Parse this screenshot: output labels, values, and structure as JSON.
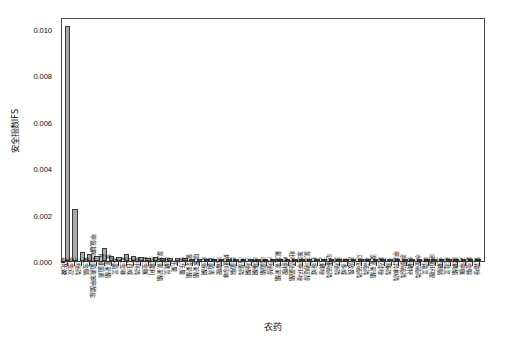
{
  "chart_data": {
    "type": "bar",
    "title": "",
    "xlabel": "农药",
    "ylabel": "安全指数IFS",
    "ylim": [
      0.0,
      0.0105
    ],
    "grid": false,
    "legend": null,
    "ytick_labels": [
      "0.000",
      "0.002",
      "0.004",
      "0.006",
      "0.008",
      "0.010"
    ],
    "ytick_values": [
      0.0,
      0.002,
      0.004,
      0.006,
      0.008,
      0.01
    ],
    "bar_color": "#a9a9a9",
    "bar_edge_color": "#3b3b3b",
    "categories": [
      "毒死蜱",
      "杀虫双",
      "三唑磷",
      "氟虫腈",
      "甲氨基阿维菌素苯甲酸盐",
      "阿维菌素",
      "氯氰菊酯",
      "多菌灵",
      "吡虫啉",
      "克百威",
      "甲拌磷",
      "啶虫脒",
      "腐霉利",
      "氯氟氰菊酯",
      "哒螨灵",
      "乐果",
      "氧乐果",
      "氰戊菊酯",
      "联苯菊酯",
      "吡蚜酮",
      "百菌清",
      "嘧霉胺",
      "烯酰吗啉",
      "异菌脲",
      "丙溴磷",
      "三唑酮",
      "噻嗪酮",
      "嘧菌酯",
      "戊唑醇",
      "氟氯氰菊酯",
      "咪鲜胺",
      "吡唑醚菌酯",
      "苯醚甲环唑",
      "氯苯嘧啶醇",
      "抗蚜威",
      "乙螨唑",
      "哒嗪硫磷",
      "氯唑磷",
      "灭多威",
      "敌敌畏",
      "马拉硫磷",
      "辛硫磷",
      "溴氰菊酯",
      "氟硅唑",
      "二嗪磷",
      "甲基异柳磷",
      "杀螟硫磷",
      "炔螨特",
      "水胺硫磷",
      "甲霜灵",
      "嘧菌环胺",
      "虫螨腈",
      "稻瘟灵",
      "螺螨酯",
      "双甲脒",
      "氟虫脲",
      "氰霜唑"
    ],
    "values": [
      0.0101,
      0.00225,
      0.00038,
      0.00031,
      0.00022,
      0.00055,
      0.00022,
      0.00016,
      0.0003,
      0.00022,
      0.00018,
      0.00014,
      0.00016,
      0.00013,
      0.00012,
      0.00011,
      0.00011,
      0.0001,
      9e-05,
      9e-05,
      8e-05,
      8e-05,
      7e-05,
      7e-05,
      7e-05,
      6e-05,
      6e-05,
      6e-05,
      5e-05,
      5e-05,
      5e-05,
      5e-05,
      4e-05,
      4e-05,
      4e-05,
      4e-05,
      3e-05,
      3e-05,
      3e-05,
      3e-05,
      3e-05,
      2e-05,
      2e-05,
      2e-05,
      2e-05,
      2e-05,
      2e-05,
      2e-05,
      1e-05,
      1e-05,
      1e-05,
      1e-05,
      1e-05,
      1e-05,
      1e-05,
      1e-05,
      1e-05
    ]
  }
}
